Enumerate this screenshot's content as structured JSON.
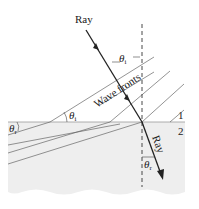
{
  "diagram": {
    "labels": {
      "incident_ray": "Ray",
      "refracted_ray": "Ray",
      "wave_fronts": "Wave fronts",
      "theta_i": "θ",
      "theta_i_sub": "i",
      "theta_r": "θ",
      "theta_r_sub": "r",
      "medium_1": "1",
      "medium_2": "2"
    },
    "colors": {
      "medium_2_fill": "#eeeeee",
      "line": "#444444",
      "ray": "#222222"
    }
  }
}
